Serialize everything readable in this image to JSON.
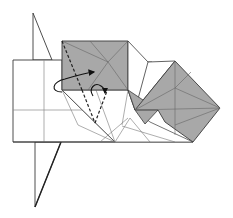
{
  "diagram": {
    "type": "origami-folding-step",
    "colors": {
      "paper_white": "#ffffff",
      "paper_colored": "#a8a8a8",
      "line": "#3a3a3a",
      "thin_line": "#6a6a6a",
      "arrow": "#111111"
    },
    "elements": {
      "top_flap": "vertical triangular flap above main rectangle",
      "bottom_flap": "vertical triangular flap below main rectangle",
      "main_rectangle": "white rectangular base with cross creases",
      "gray_square": "shaded square with diagonal creases, top center",
      "gray_diamond": "shaded diamond-shaped square, right side",
      "valley_folds": "two dashed fold lines forming a V",
      "arrows": [
        "large curved fold arrow",
        "small hooked fold arrow"
      ]
    }
  }
}
